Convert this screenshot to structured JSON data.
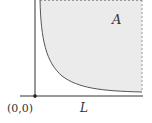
{
  "diagram": {
    "region_label": "A",
    "axis_label_x": "L",
    "origin_label": "(0,0)",
    "colors": {
      "region_fill": "#ebebeb",
      "axis": "#333333",
      "curve": "#555555",
      "dashed_boundary": "#999999",
      "origin_dot": "#222222"
    },
    "curve_type": "hyperbola-like boundary (region above/right of curve shaded)"
  }
}
